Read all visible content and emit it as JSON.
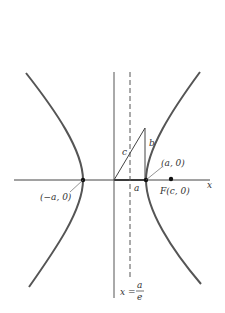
{
  "diagram": {
    "type": "hyperbola-geometry",
    "labels": {
      "x_axis": "x",
      "left_vertex": "(−a, 0)",
      "right_vertex": "(a, 0)",
      "focus": "F(c, 0)",
      "hyp_c": "c",
      "side_b": "b",
      "a_mark": "a",
      "directrix_lhs": "x =",
      "directrix_num": "a",
      "directrix_den": "e"
    },
    "colors": {
      "curve": "#555555",
      "axis": "#444444",
      "point": "#111111"
    }
  }
}
